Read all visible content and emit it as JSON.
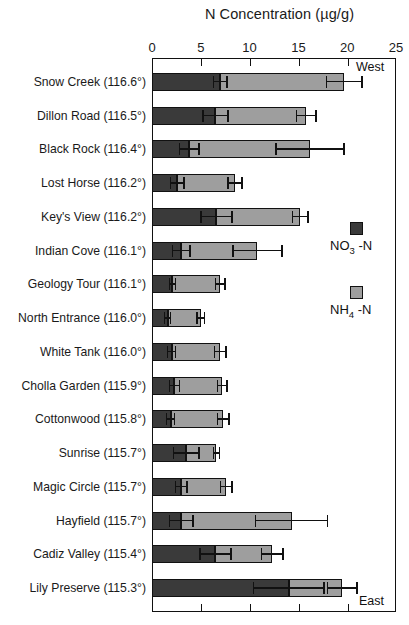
{
  "chart_data": {
    "type": "bar",
    "orientation": "horizontal",
    "stacked": true,
    "title": "N Concentration (µg/g)",
    "xlabel": "N Concentration (µg/g)",
    "ylabel": "",
    "xlim": [
      0,
      25
    ],
    "xticks": [
      0,
      5,
      10,
      15,
      20,
      25
    ],
    "xtick_labels": [
      "0",
      "5",
      "10",
      "15",
      "20",
      "25"
    ],
    "grid": false,
    "legend_position": "right-middle",
    "categories": [
      "Snow Creek (116.6°)",
      "Dillon Road (116.5°)",
      "Black Rock (116.4°)",
      "Lost Horse (116.2°)",
      "Key's View  (116.2°)",
      "Indian Cove (116.1°)",
      "Geology Tour (116.1°)",
      "North Entrance (116.0°)",
      "White Tank (116.0°)",
      "Cholla Garden (115.9°)",
      "Cottonwood (115.8°)",
      "Sunrise  (115.7°)",
      "Magic Circle (115.7°)",
      "Hayfield (115.7°)",
      "Cadiz Valley (115.4°)",
      "Lily Preserve (115.3°)"
    ],
    "series": [
      {
        "name": "NO3 -N",
        "color": "#3a3a3a",
        "values": [
          7.0,
          6.5,
          3.8,
          2.6,
          6.6,
          3.0,
          2.1,
          1.6,
          2.0,
          2.3,
          1.9,
          3.5,
          3.0,
          3.0,
          6.5,
          14.0
        ],
        "errors": [
          0.7,
          1.3,
          1.0,
          0.7,
          1.6,
          0.9,
          0.3,
          0.3,
          0.4,
          0.5,
          0.4,
          1.3,
          0.6,
          1.2,
          1.6,
          3.6
        ]
      },
      {
        "name": "NH4 -N",
        "color": "#9e9e9e",
        "values": [
          12.7,
          9.3,
          12.4,
          5.9,
          8.6,
          7.8,
          4.9,
          3.4,
          5.0,
          4.9,
          5.4,
          3.1,
          4.6,
          11.3,
          5.8,
          5.5
        ],
        "errors": [
          1.8,
          1.0,
          3.5,
          0.7,
          0.8,
          2.5,
          0.5,
          0.4,
          0.6,
          0.5,
          0.6,
          0.3,
          0.6,
          3.7,
          1.1,
          1.5
        ]
      }
    ],
    "totals": [
      19.7,
      15.8,
      16.2,
      8.5,
      15.2,
      10.8,
      7.0,
      5.0,
      7.0,
      7.2,
      7.3,
      6.6,
      7.6,
      14.3,
      12.3,
      19.5
    ],
    "annotations": {
      "top_right": "West",
      "bottom_right": "East"
    }
  },
  "legend": {
    "items": [
      {
        "label_main": "NO",
        "label_sub": "3",
        "label_tail": " -N",
        "swatch": "dark-square-swatch"
      },
      {
        "label_main": "NH",
        "label_sub": "4",
        "label_tail": " -N",
        "swatch": "light-square-swatch"
      }
    ]
  },
  "title_parts": {
    "main": "N Concentration (µg/g)"
  }
}
